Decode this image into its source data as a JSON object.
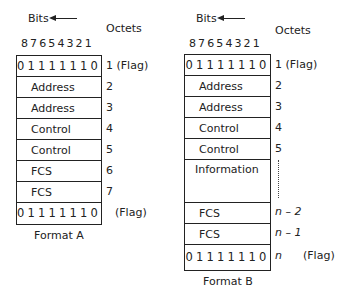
{
  "header": {
    "bits_label": "Bits",
    "octets_label": "Octets",
    "bit_numbers": "87654321"
  },
  "format_a": {
    "caption": "Format A",
    "rows": [
      {
        "field": "01111110",
        "octet": "1 (Flag)"
      },
      {
        "field": "Address",
        "octet": "2"
      },
      {
        "field": "Address",
        "octet": "3"
      },
      {
        "field": "Control",
        "octet": "4"
      },
      {
        "field": "Control",
        "octet": "5"
      },
      {
        "field": "FCS",
        "octet": "6"
      },
      {
        "field": "FCS",
        "octet": "7"
      },
      {
        "field": "01111110",
        "octet": "(Flag)"
      }
    ]
  },
  "format_b": {
    "caption": "Format B",
    "rows": [
      {
        "field": "01111110",
        "octet": "1 (Flag)"
      },
      {
        "field": "Address",
        "octet": "2"
      },
      {
        "field": "Address",
        "octet": "3"
      },
      {
        "field": "Control",
        "octet": "4"
      },
      {
        "field": "Control",
        "octet": "5"
      },
      {
        "field": "Information",
        "octet": ""
      },
      {
        "field": "FCS",
        "octet": "n – 2"
      },
      {
        "field": "FCS",
        "octet": "n – 1"
      },
      {
        "field": "01111110",
        "octet": "n",
        "flag_note": "(Flag)"
      }
    ]
  }
}
